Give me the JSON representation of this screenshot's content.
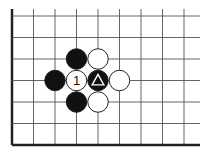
{
  "diagram": {
    "type": "go-board-fragment",
    "colors": {
      "background": "#ffffff",
      "grid_line": "#555555",
      "edge_line": "#222222",
      "black_stone": "#111111",
      "white_stone": "#ffffff",
      "stone_outline": "#222222"
    },
    "grid": {
      "origin_x": 12,
      "origin_y": 16,
      "spacing": 21.5,
      "columns": 9,
      "rows": 7,
      "right_extent": 200,
      "top_extent": 9,
      "edges": [
        "left",
        "bottom"
      ]
    },
    "stones": [
      {
        "col": 3,
        "row": 2,
        "color": "black",
        "label": ""
      },
      {
        "col": 4,
        "row": 2,
        "color": "white",
        "label": ""
      },
      {
        "col": 2,
        "row": 3,
        "color": "black",
        "label": ""
      },
      {
        "col": 3,
        "row": 3,
        "color": "white",
        "label": "1"
      },
      {
        "col": 4,
        "row": 3,
        "color": "black",
        "label": "",
        "marker": "triangle"
      },
      {
        "col": 5,
        "row": 3,
        "color": "white",
        "label": ""
      },
      {
        "col": 3,
        "row": 4,
        "color": "black",
        "label": ""
      },
      {
        "col": 4,
        "row": 4,
        "color": "white",
        "label": ""
      }
    ]
  }
}
